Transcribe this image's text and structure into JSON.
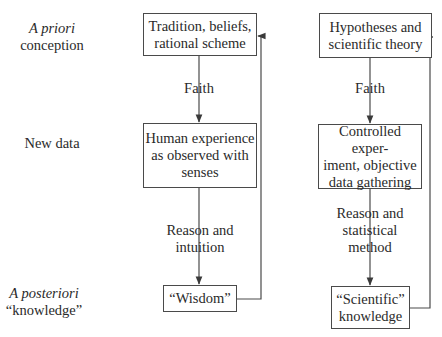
{
  "row_labels": {
    "a_priori": {
      "italic": "A priori",
      "rest": "conception"
    },
    "new_data": {
      "text": "New data"
    },
    "a_posteriori": {
      "italic": "A posteriori",
      "rest": "“knowledge”"
    }
  },
  "left_column": {
    "box_top": {
      "line1": "Tradition, beliefs,",
      "line2": "rational scheme"
    },
    "edge_top": {
      "label": "Faith"
    },
    "box_middle": {
      "line1": "Human experience",
      "line2": "as observed with",
      "line3": "senses"
    },
    "edge_bottom": {
      "line1": "Reason and",
      "line2": "intuition"
    },
    "box_bottom": {
      "line1": "“Wisdom”"
    }
  },
  "right_column": {
    "box_top": {
      "line1": "Hypotheses and",
      "line2": "scientific theory"
    },
    "edge_top": {
      "label": "Faith"
    },
    "box_middle": {
      "line1": "Controlled exper-",
      "line2": "iment, objective",
      "line3": "data gathering"
    },
    "edge_bottom": {
      "line1": "Reason and",
      "line2": "statistical",
      "line3": "method"
    },
    "box_bottom": {
      "line1": "“Scientific”",
      "line2": "knowledge"
    }
  },
  "colors": {
    "line": "#4a4a4a",
    "text": "#2a2a2a",
    "background": "#ffffff"
  }
}
